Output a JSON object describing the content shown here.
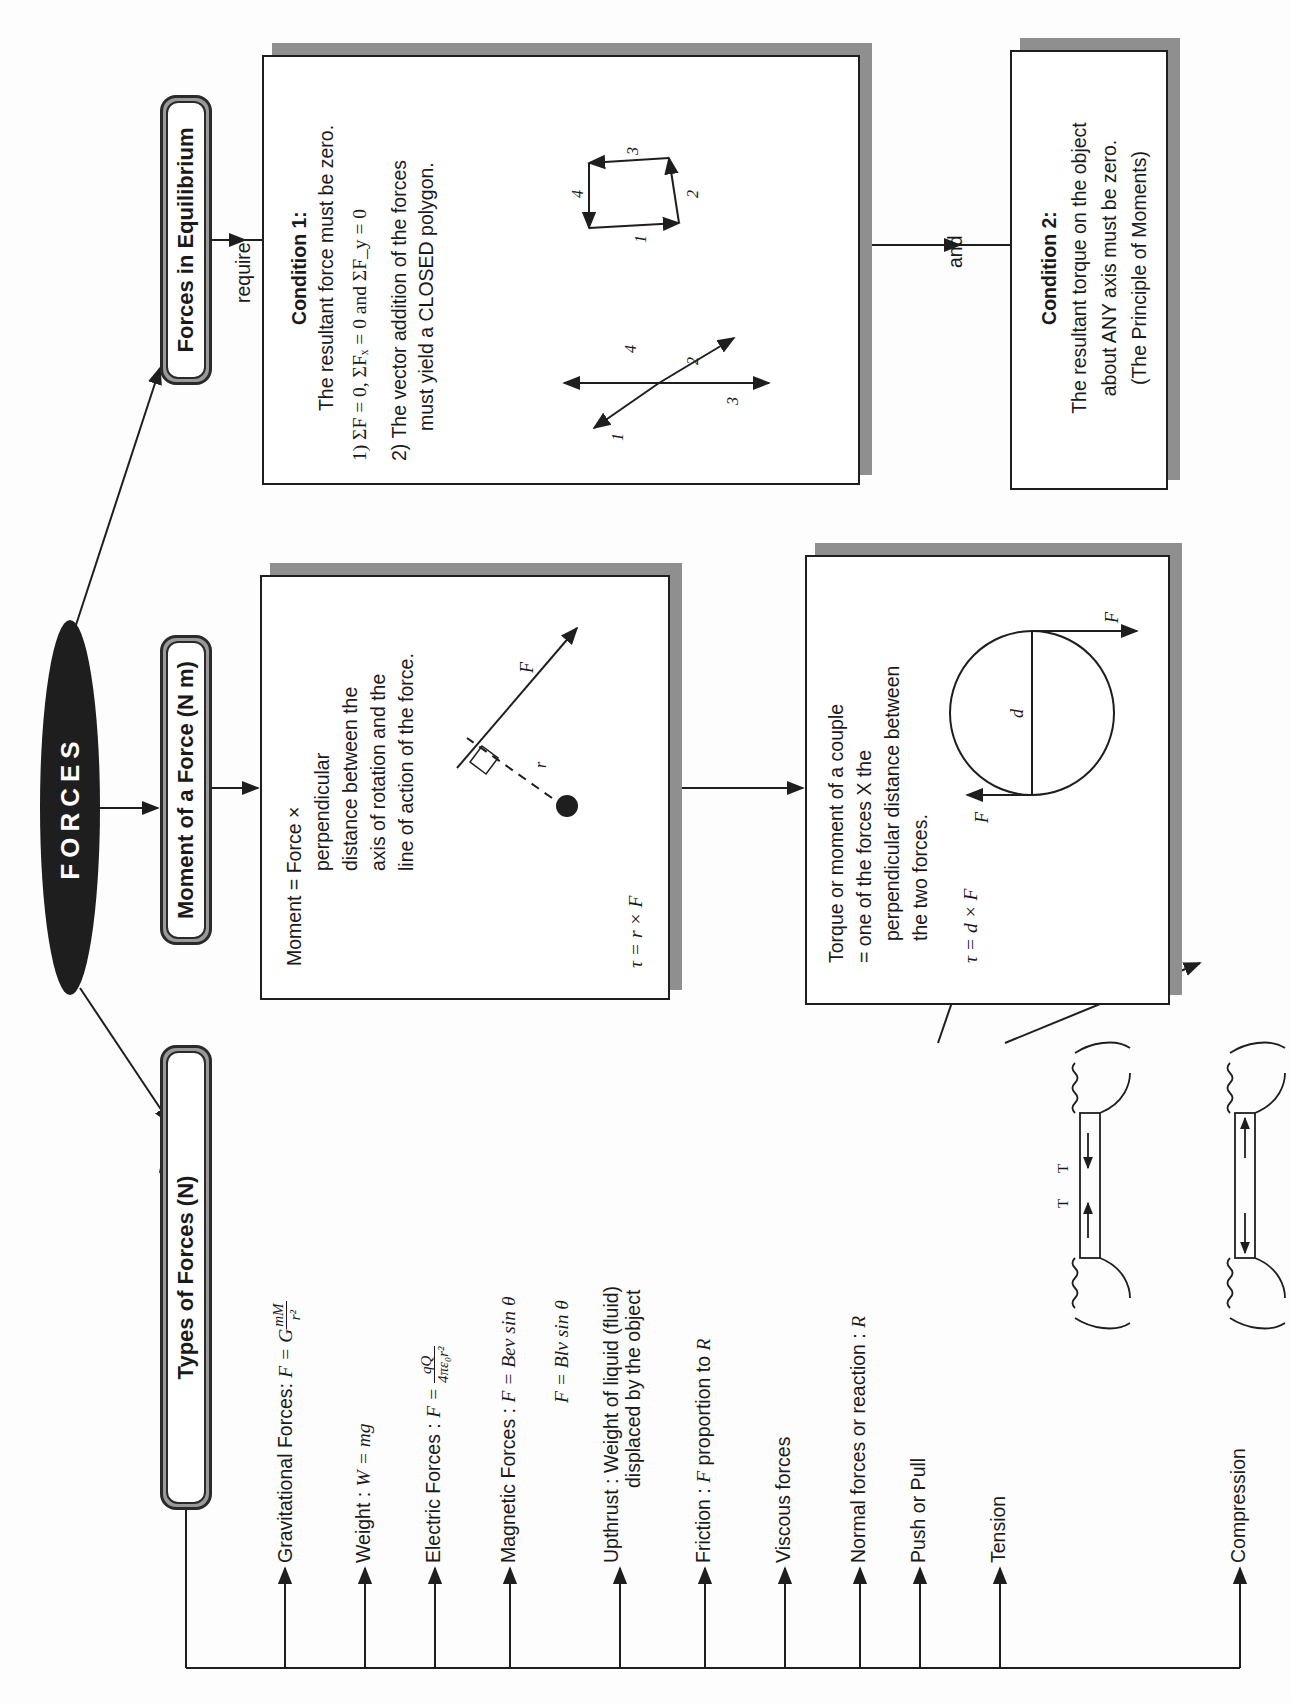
{
  "page": {
    "orientation": "rotated-90-ccw",
    "root": {
      "label": "FORCES"
    },
    "branches": {
      "types": {
        "title": "Types of Forces (N)",
        "items": [
          {
            "label": "Gravitational Forces: ",
            "formula": "F = G",
            "frac_num": "mM",
            "frac_den": "r²"
          },
          {
            "label": "Weight : ",
            "formula": "W = mg"
          },
          {
            "label": "Electric Forces : ",
            "formula": "F = ",
            "frac_num": "qQ",
            "frac_den": "4πε₀r²"
          },
          {
            "label": "Magnetic Forces : ",
            "formula": "F = Bev sin θ",
            "formula2": "F = Blv sin θ"
          },
          {
            "label": "Upthrust : Weight of liquid (fluid)",
            "label2": "displaced by the object"
          },
          {
            "label": "Friction : ",
            "formula": "F",
            "suffix": " proportion to ",
            "formula_b": "R"
          },
          {
            "label": "Viscous forces"
          },
          {
            "label": "Normal forces or reaction : ",
            "formula": "R"
          },
          {
            "label": "Push or Pull"
          },
          {
            "label": "Tension"
          },
          {
            "label": "Compression"
          }
        ],
        "tension_labels": [
          "T",
          "T"
        ]
      },
      "moment": {
        "title": "Moment of a Force (N m)",
        "definition": {
          "line1": "Moment = Force ×",
          "line2": "perpendicular",
          "line3": "distance between the",
          "line4": "axis of rotation and the",
          "line5": "line of action of the force."
        },
        "diagram_labels": {
          "force": "F",
          "radius": "r"
        },
        "formula": "τ = r × F",
        "couple": {
          "line1": "Torque or moment of a couple",
          "line2": "= one of the forces X the",
          "line3": "perpendicular distance between",
          "line4": "the two forces.",
          "formula": "τ = d × F",
          "diagram_labels": {
            "force_left": "F",
            "force_right": "F",
            "diameter": "d"
          }
        }
      },
      "equilibrium": {
        "title": "Forces in Equilibrium",
        "connector_require": "require",
        "connector_and": "and",
        "condition1": {
          "title": "Condition 1:",
          "line1": "The resultant force must be zero.",
          "line2": "1) ΣF = 0, ΣFₓ = 0 and ΣF_y = 0",
          "line3": "2) The vector addition of the forces",
          "line4": "must yield a CLOSED polygon.",
          "vector_labels": [
            "1",
            "2",
            "3",
            "4"
          ]
        },
        "condition2": {
          "title": "Condition 2:",
          "line1": "The resultant torque on the object",
          "line2": "about ANY axis must be zero.",
          "line3": "(The Principle of Moments)"
        }
      }
    },
    "colors": {
      "ink": "#1e1e1e",
      "shadow": "#8f8f8f",
      "pill_fill": "#9a9a9a",
      "paper": "#fdfdfd"
    }
  }
}
